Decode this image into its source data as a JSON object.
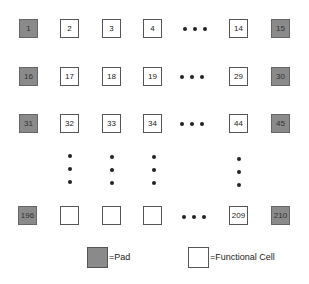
{
  "diagram": {
    "rows": [
      {
        "cells": [
          {
            "label": "1",
            "type": "pad"
          },
          {
            "label": "2",
            "type": "functional"
          },
          {
            "label": "3",
            "type": "functional"
          },
          {
            "label": "4",
            "type": "functional"
          },
          {
            "label": "14",
            "type": "functional"
          },
          {
            "label": "15",
            "type": "pad"
          }
        ]
      },
      {
        "cells": [
          {
            "label": "16",
            "type": "pad"
          },
          {
            "label": "17",
            "type": "functional"
          },
          {
            "label": "18",
            "type": "functional"
          },
          {
            "label": "19",
            "type": "functional"
          },
          {
            "label": "29",
            "type": "functional"
          },
          {
            "label": "30",
            "type": "pad"
          }
        ]
      },
      {
        "cells": [
          {
            "label": "31",
            "type": "pad"
          },
          {
            "label": "32",
            "type": "functional"
          },
          {
            "label": "33",
            "type": "functional"
          },
          {
            "label": "34",
            "type": "functional"
          },
          {
            "label": "44",
            "type": "functional"
          },
          {
            "label": "45",
            "type": "pad"
          }
        ]
      },
      {
        "cells": [
          {
            "label": "196",
            "type": "pad"
          },
          {
            "label": "",
            "type": "functional"
          },
          {
            "label": "",
            "type": "functional"
          },
          {
            "label": "",
            "type": "functional"
          },
          {
            "label": "209",
            "type": "functional"
          },
          {
            "label": "210",
            "type": "pad"
          }
        ]
      }
    ],
    "ellipsis": "•••"
  },
  "legend": {
    "pad_label": "=Pad",
    "functional_label": "=Functional Cell"
  },
  "colors": {
    "pad_fill": "#8a8a8a",
    "functional_fill": "#ffffff",
    "border": "#555555"
  }
}
